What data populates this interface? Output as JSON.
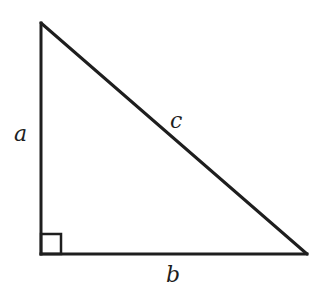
{
  "diagram": {
    "colors": {
      "stroke": "#1e1e1e",
      "label": "#1e1e1e",
      "background": "#ffffff"
    },
    "vertices": {
      "top": {
        "x": 41,
        "y": 23
      },
      "bottom_left": {
        "x": 41,
        "y": 254
      },
      "bottom_right": {
        "x": 307,
        "y": 254
      }
    },
    "right_angle_marker": {
      "x": 41,
      "y": 234,
      "size": 20
    },
    "labels": {
      "a": "a",
      "b": "b",
      "c": "c"
    },
    "label_positions": {
      "a": {
        "x": 14,
        "y": 141
      },
      "b": {
        "x": 166,
        "y": 282
      },
      "c": {
        "x": 170,
        "y": 128
      }
    },
    "sides": [
      {
        "name": "a",
        "role": "vertical leg"
      },
      {
        "name": "b",
        "role": "horizontal leg"
      },
      {
        "name": "c",
        "role": "hypotenuse"
      }
    ]
  }
}
